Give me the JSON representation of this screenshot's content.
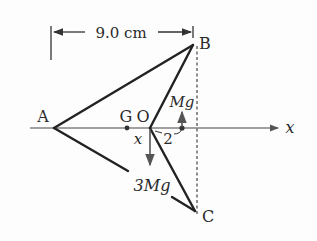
{
  "diagram": {
    "dimension_label": "9.0 cm",
    "points": {
      "A": "A",
      "B": "B",
      "C": "C",
      "G": "G",
      "O": "O"
    },
    "axis_label": "x",
    "distance_label": "x",
    "offset_label": "2",
    "force_up": "Mg",
    "force_down": "3Mg",
    "colors": {
      "line": "#222222",
      "arrow": "#555555",
      "background": "#fdfdfd"
    }
  }
}
